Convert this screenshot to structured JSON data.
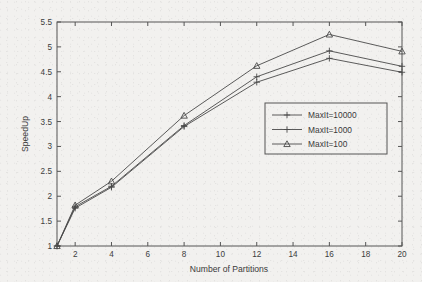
{
  "chart_data": {
    "type": "line",
    "title": "",
    "subtitle": "",
    "xlabel": "Number of Partitions",
    "ylabel": "SpeedUp",
    "x": [
      1,
      2,
      4,
      8,
      12,
      16,
      20
    ],
    "xlim": [
      1,
      20
    ],
    "ylim": [
      1,
      5.5
    ],
    "xticks": [
      2,
      4,
      6,
      8,
      10,
      12,
      14,
      16,
      18,
      20
    ],
    "xtick_labels": [
      "2",
      "4",
      "6",
      "8",
      "10",
      "12",
      "14",
      "16",
      "18",
      "20"
    ],
    "yticks": [
      1,
      1.5,
      2,
      2.5,
      3,
      3.5,
      4,
      4.5,
      5,
      5.5
    ],
    "ytick_labels": [
      "1",
      "1.5",
      "2",
      "2.5",
      "3",
      "3.5",
      "4",
      "4.5",
      "5",
      "5.5"
    ],
    "grid": false,
    "legend_position": "center-right",
    "line_color": "#4a4a4a",
    "background_color": "#f2f1ef",
    "series": [
      {
        "name": "MaxIt=10000",
        "marker": "plus",
        "values": [
          1.0,
          1.79,
          2.2,
          3.42,
          4.4,
          4.92,
          4.61
        ]
      },
      {
        "name": "MaxIt=1000",
        "marker": "plus",
        "values": [
          1.0,
          1.76,
          2.18,
          3.4,
          4.29,
          4.77,
          4.49
        ]
      },
      {
        "name": "MaxIt=100",
        "marker": "triangle",
        "values": [
          1.0,
          1.82,
          2.3,
          3.62,
          4.62,
          5.25,
          4.91
        ]
      }
    ]
  },
  "legend": {
    "entries": [
      {
        "label": "MaxIt=10000",
        "marker": "plus"
      },
      {
        "label": "MaxIt=1000",
        "marker": "plus"
      },
      {
        "label": "MaxIt=100",
        "marker": "triangle"
      }
    ]
  }
}
